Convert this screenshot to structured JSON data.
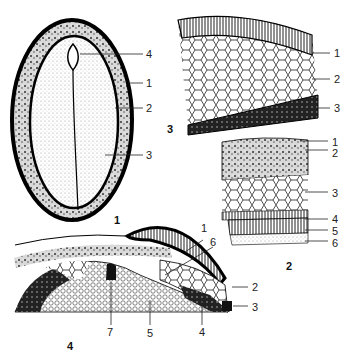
{
  "figures": [
    {
      "number": "1",
      "labels": [
        "4",
        "1",
        "2",
        "3"
      ]
    },
    {
      "number": "2",
      "labels": [
        "1",
        "2",
        "3",
        "4",
        "5",
        "6"
      ]
    },
    {
      "number": "3",
      "labels": [
        "1",
        "2",
        "3"
      ]
    },
    {
      "number": "4",
      "labels": [
        "1",
        "6",
        "2",
        "3",
        "7",
        "5",
        "4"
      ]
    }
  ],
  "fig1": {
    "num": "1",
    "l4": "4",
    "l1": "1",
    "l2": "2",
    "l3": "3"
  },
  "fig3": {
    "num": "3",
    "l1": "1",
    "l2": "2",
    "l3": "3"
  },
  "fig2": {
    "num": "2",
    "l1": "1",
    "l2": "2",
    "l3": "3",
    "l4": "4",
    "l5": "5",
    "l6": "6"
  },
  "fig4": {
    "num": "4",
    "l1": "1",
    "l6": "6",
    "l2": "2",
    "l3": "3",
    "l7": "7",
    "l5": "5",
    "l4": "4"
  }
}
